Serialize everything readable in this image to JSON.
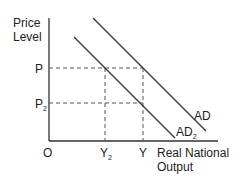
{
  "diagram": {
    "y_axis_label": [
      "Price",
      "Level"
    ],
    "x_axis_label": [
      "Real National",
      "Output"
    ],
    "origin_label": "O",
    "price_labels": {
      "p": "P",
      "p2_base": "P",
      "p2_sub": "2"
    },
    "output_labels": {
      "y2_base": "Y",
      "y2_sub": "2",
      "y": "Y"
    },
    "curves": [
      {
        "base": "AD",
        "sub": ""
      },
      {
        "base": "AD",
        "sub": "2"
      }
    ],
    "colors": {
      "line": "#333333",
      "dash": "#555555",
      "text": "#222222"
    }
  }
}
